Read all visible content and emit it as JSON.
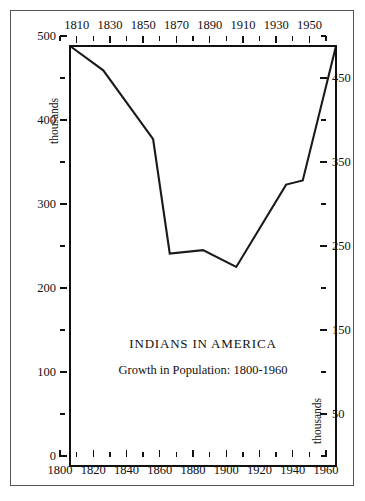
{
  "chart_data": {
    "type": "line",
    "title": "INDIANS IN AMERICA",
    "subtitle": "Growth in Population: 1800-1960",
    "xlabel": "",
    "ylabel": "thousands",
    "ylabel_right": "thousands",
    "xlim": [
      1800,
      1960
    ],
    "ylim": [
      0,
      500
    ],
    "grid": false,
    "legend": null,
    "x": [
      1800,
      1820,
      1850,
      1860,
      1880,
      1900,
      1930,
      1940,
      1960
    ],
    "values": [
      500,
      471,
      389,
      253,
      257,
      237,
      335,
      340,
      500
    ],
    "series": [
      {
        "name": "Indian population (thousands)",
        "x": [
          1800,
          1820,
          1850,
          1860,
          1880,
          1900,
          1930,
          1940,
          1960
        ],
        "values": [
          500,
          471,
          389,
          253,
          257,
          237,
          335,
          340,
          500
        ]
      }
    ],
    "x_axis_bottom": {
      "tick_labels": [
        "1800",
        "1820",
        "1840",
        "1860",
        "1880",
        "1900",
        "1920",
        "1940",
        "1960"
      ],
      "tick_values": [
        1800,
        1820,
        1840,
        1860,
        1880,
        1900,
        1920,
        1940,
        1960
      ],
      "minor_tick_values": [
        1810,
        1830,
        1850,
        1870,
        1890,
        1910,
        1930,
        1950
      ]
    },
    "x_axis_top": {
      "tick_labels": [
        "1810",
        "1830",
        "1850",
        "1870",
        "1890",
        "1910",
        "1930",
        "1950"
      ],
      "tick_values": [
        1810,
        1830,
        1850,
        1870,
        1890,
        1910,
        1930,
        1950
      ],
      "minor_tick_values": [
        1800,
        1820,
        1840,
        1860,
        1880,
        1900,
        1920,
        1940,
        1960
      ]
    },
    "y_axis_left": {
      "tick_labels": [
        "500",
        "400",
        "300",
        "200",
        "100",
        "0"
      ],
      "tick_values": [
        500,
        400,
        300,
        200,
        100,
        0
      ],
      "minor_tick_values": [
        450,
        350,
        250,
        150,
        50
      ]
    },
    "y_axis_right": {
      "tick_labels": [
        "450",
        "350",
        "250",
        "150",
        "50"
      ],
      "tick_values": [
        450,
        350,
        250,
        150,
        50
      ],
      "minor_tick_values": [
        500,
        400,
        300,
        200,
        100,
        0
      ]
    },
    "line_color": "#1a1a1a",
    "background_color": "#ffffff",
    "border_color": "#555555"
  }
}
